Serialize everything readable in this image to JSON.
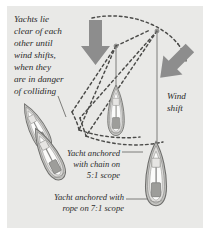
{
  "figure": {
    "panel_color": "#e9e9e7",
    "background_color": "#ffffff",
    "ink_color": "#2b2b2b",
    "arrow_color": "#8d8d8d",
    "hull_color": "#c9c9c6",
    "deck_color": "#f2f2f0"
  },
  "captions": {
    "main": "Yachts lie\nclear of each\nother until\nwind shifts,\nwhen they\nare in danger\nof colliding",
    "wind_shift": "Wind\nshift",
    "chain_scope": "Yacht anchored\nwith chain on\n5:1 scope",
    "rope_scope": "Yacht anchored with\nrope on 7:1 scope"
  },
  "arrows": [
    {
      "name": "original-wind-arrow",
      "direction": "down",
      "angle_deg": 0
    },
    {
      "name": "wind-shift-arrow",
      "direction": "down-left",
      "angle_deg": 45
    }
  ],
  "yachts": [
    {
      "name": "yacht-upper-left",
      "orientation_deg": -28,
      "state": "swung"
    },
    {
      "name": "yacht-lower-left",
      "orientation_deg": -28,
      "state": "swung"
    },
    {
      "name": "yacht-chain",
      "orientation_deg": 0,
      "state": "anchored-chain"
    },
    {
      "name": "yacht-rope",
      "orientation_deg": 0,
      "state": "anchored-rope"
    }
  ],
  "swing_circles": [
    {
      "name": "chain-swing-arc",
      "scope": "5:1"
    },
    {
      "name": "rope-swing-arc",
      "scope": "7:1"
    }
  ]
}
